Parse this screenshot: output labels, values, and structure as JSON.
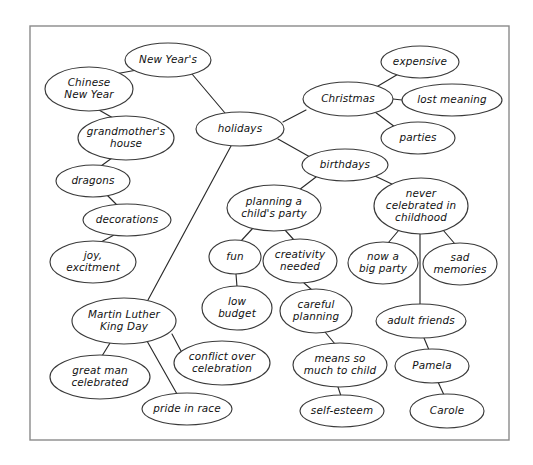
{
  "document": {
    "kind": "concept-map",
    "title": "Holidays concept map",
    "frame": {
      "x": 30,
      "y": 26,
      "width": 479,
      "height": 414
    },
    "canvas": {
      "width": 533,
      "height": 465
    },
    "colors": {
      "background": "#ffffff",
      "frame_stroke": "#8a8a8a",
      "node_stroke": "#3a3a3a",
      "node_fill": "#ffffff",
      "edge_stroke": "#2b2b2b",
      "text": "#111111"
    }
  },
  "nodes": [
    {
      "id": "new-years",
      "label": "New Year's",
      "lines": [
        "New Year's"
      ],
      "cx": 168,
      "cy": 60,
      "rx": 43,
      "ry": 17
    },
    {
      "id": "chinese-new-year",
      "label": "Chinese New Year",
      "lines": [
        "Chinese",
        "New Year"
      ],
      "cx": 89,
      "cy": 89,
      "rx": 44,
      "ry": 22
    },
    {
      "id": "holidays",
      "label": "holidays",
      "lines": [
        "holidays"
      ],
      "cx": 240,
      "cy": 129,
      "rx": 44,
      "ry": 17
    },
    {
      "id": "christmas",
      "label": "Christmas",
      "lines": [
        "Christmas"
      ],
      "cx": 348,
      "cy": 99,
      "rx": 45,
      "ry": 17
    },
    {
      "id": "expensive",
      "label": "expensive",
      "lines": [
        "expensive"
      ],
      "cx": 420,
      "cy": 62,
      "rx": 39,
      "ry": 16
    },
    {
      "id": "lost-meaning",
      "label": "lost meaning",
      "lines": [
        "lost meaning"
      ],
      "cx": 452,
      "cy": 100,
      "rx": 50,
      "ry": 16
    },
    {
      "id": "parties",
      "label": "parties",
      "lines": [
        "parties"
      ],
      "cx": 418,
      "cy": 138,
      "rx": 37,
      "ry": 16
    },
    {
      "id": "birthdays",
      "label": "birthdays",
      "lines": [
        "birthdays"
      ],
      "cx": 345,
      "cy": 165,
      "rx": 43,
      "ry": 16
    },
    {
      "id": "grandmothers-house",
      "label": "grandmother's house",
      "lines": [
        "grandmother's",
        "house"
      ],
      "cx": 126,
      "cy": 138,
      "rx": 48,
      "ry": 22
    },
    {
      "id": "dragons",
      "label": "dragons",
      "lines": [
        "dragons"
      ],
      "cx": 93,
      "cy": 181,
      "rx": 37,
      "ry": 16
    },
    {
      "id": "decorations",
      "label": "decorations",
      "lines": [
        "decorations"
      ],
      "cx": 127,
      "cy": 220,
      "rx": 44,
      "ry": 16
    },
    {
      "id": "joy-excitment",
      "label": "joy, excitment",
      "lines": [
        "joy,",
        "excitment"
      ],
      "cx": 93,
      "cy": 262,
      "rx": 43,
      "ry": 21
    },
    {
      "id": "mlk-day",
      "label": "Martin Luther King Day",
      "lines": [
        "Martin Luther",
        "King Day"
      ],
      "cx": 124,
      "cy": 321,
      "rx": 52,
      "ry": 23
    },
    {
      "id": "great-man",
      "label": "great man celebrated",
      "lines": [
        "great man",
        "celebrated"
      ],
      "cx": 100,
      "cy": 377,
      "rx": 50,
      "ry": 22
    },
    {
      "id": "conflict",
      "label": "conflict over celebration",
      "lines": [
        "conflict over",
        "celebration"
      ],
      "cx": 222,
      "cy": 363,
      "rx": 48,
      "ry": 22
    },
    {
      "id": "pride-in-race",
      "label": "pride in race",
      "lines": [
        "pride in race"
      ],
      "cx": 187,
      "cy": 409,
      "rx": 45,
      "ry": 16
    },
    {
      "id": "planning-party",
      "label": "planning a child's party",
      "lines": [
        "planning a",
        "child's party"
      ],
      "cx": 274,
      "cy": 208,
      "rx": 47,
      "ry": 23
    },
    {
      "id": "fun",
      "label": "fun",
      "lines": [
        "fun"
      ],
      "cx": 235,
      "cy": 257,
      "rx": 26,
      "ry": 17
    },
    {
      "id": "creativity-needed",
      "label": "creativity needed",
      "lines": [
        "creativity",
        "needed"
      ],
      "cx": 300,
      "cy": 261,
      "rx": 37,
      "ry": 22
    },
    {
      "id": "low-budget",
      "label": "low budget",
      "lines": [
        "low",
        "budget"
      ],
      "cx": 237,
      "cy": 308,
      "rx": 35,
      "ry": 22
    },
    {
      "id": "careful-planning",
      "label": "careful planning",
      "lines": [
        "careful",
        "planning"
      ],
      "cx": 316,
      "cy": 311,
      "rx": 36,
      "ry": 22
    },
    {
      "id": "means-so-much",
      "label": "means so much to child",
      "lines": [
        "means so",
        "much to child"
      ],
      "cx": 340,
      "cy": 365,
      "rx": 47,
      "ry": 22
    },
    {
      "id": "self-esteem",
      "label": "self-esteem",
      "lines": [
        "self-esteem"
      ],
      "cx": 342,
      "cy": 411,
      "rx": 42,
      "ry": 16
    },
    {
      "id": "never-celebrated",
      "label": "never celebrated in childhood",
      "lines": [
        "never",
        "celebrated in",
        "childhood"
      ],
      "cx": 421,
      "cy": 206,
      "rx": 47,
      "ry": 28
    },
    {
      "id": "now-a-big-party",
      "label": "now a big party",
      "lines": [
        "now a",
        "big party"
      ],
      "cx": 383,
      "cy": 263,
      "rx": 35,
      "ry": 21
    },
    {
      "id": "sad-memories",
      "label": "sad memories",
      "lines": [
        "sad",
        "memories"
      ],
      "cx": 460,
      "cy": 264,
      "rx": 37,
      "ry": 21
    },
    {
      "id": "adult-friends",
      "label": "adult friends",
      "lines": [
        "adult friends"
      ],
      "cx": 421,
      "cy": 321,
      "rx": 45,
      "ry": 17
    },
    {
      "id": "pamela",
      "label": "Pamela",
      "lines": [
        "Pamela"
      ],
      "cx": 432,
      "cy": 366,
      "rx": 37,
      "ry": 17
    },
    {
      "id": "carole",
      "label": "Carole",
      "lines": [
        "Carole"
      ],
      "cx": 447,
      "cy": 411,
      "rx": 37,
      "ry": 17
    }
  ],
  "edges": [
    {
      "from": "new-years",
      "to": "chinese-new-year",
      "x1": 137,
      "y1": 70,
      "x2": 115,
      "y2": 74
    },
    {
      "from": "new-years",
      "to": "holidays",
      "x1": 192,
      "y1": 74,
      "x2": 225,
      "y2": 113
    },
    {
      "from": "chinese-new-year",
      "to": "grandmothers-house",
      "x1": 99,
      "y1": 110,
      "x2": 113,
      "y2": 118
    },
    {
      "from": "grandmothers-house",
      "to": "dragons",
      "x1": 112,
      "y1": 158,
      "x2": 101,
      "y2": 166
    },
    {
      "from": "dragons",
      "to": "decorations",
      "x1": 107,
      "y1": 195,
      "x2": 117,
      "y2": 205
    },
    {
      "from": "decorations",
      "to": "joy-excitment",
      "x1": 114,
      "y1": 235,
      "x2": 101,
      "y2": 242
    },
    {
      "from": "holidays",
      "to": "christmas",
      "x1": 283,
      "y1": 122,
      "x2": 306,
      "y2": 110
    },
    {
      "from": "holidays",
      "to": "birthdays",
      "x1": 278,
      "y1": 139,
      "x2": 310,
      "y2": 157
    },
    {
      "from": "holidays",
      "to": "mlk-day",
      "x1": 231,
      "y1": 146,
      "x2": 148,
      "y2": 300
    },
    {
      "from": "christmas",
      "to": "expensive",
      "x1": 378,
      "y1": 86,
      "x2": 400,
      "y2": 73
    },
    {
      "from": "christmas",
      "to": "lost-meaning",
      "x1": 393,
      "y1": 99,
      "x2": 402,
      "y2": 100
    },
    {
      "from": "christmas",
      "to": "parties",
      "x1": 375,
      "y1": 112,
      "x2": 395,
      "y2": 127
    },
    {
      "from": "birthdays",
      "to": "planning-party",
      "x1": 316,
      "y1": 177,
      "x2": 299,
      "y2": 190
    },
    {
      "from": "birthdays",
      "to": "never-celebrated",
      "x1": 375,
      "y1": 176,
      "x2": 396,
      "y2": 186
    },
    {
      "from": "planning-party",
      "to": "fun",
      "x1": 253,
      "y1": 228,
      "x2": 241,
      "y2": 241
    },
    {
      "from": "planning-party",
      "to": "creativity-needed",
      "x1": 285,
      "y1": 230,
      "x2": 294,
      "y2": 240
    },
    {
      "from": "fun",
      "to": "low-budget",
      "x1": 236,
      "y1": 274,
      "x2": 237,
      "y2": 287
    },
    {
      "from": "creativity-needed",
      "to": "careful-planning",
      "x1": 304,
      "y1": 283,
      "x2": 312,
      "y2": 290
    },
    {
      "from": "careful-planning",
      "to": "means-so-much",
      "x1": 325,
      "y1": 332,
      "x2": 335,
      "y2": 344
    },
    {
      "from": "means-so-much",
      "to": "self-esteem",
      "x1": 338,
      "y1": 387,
      "x2": 341,
      "y2": 396
    },
    {
      "from": "never-celebrated",
      "to": "now-a-big-party",
      "x1": 399,
      "y1": 230,
      "x2": 388,
      "y2": 243
    },
    {
      "from": "never-celebrated",
      "to": "sad-memories",
      "x1": 443,
      "y1": 230,
      "x2": 455,
      "y2": 244
    },
    {
      "from": "never-celebrated",
      "to": "adult-friends",
      "x1": 420,
      "y1": 234,
      "x2": 420,
      "y2": 305
    },
    {
      "from": "adult-friends",
      "to": "pamela",
      "x1": 424,
      "y1": 338,
      "x2": 429,
      "y2": 350
    },
    {
      "from": "pamela",
      "to": "carole",
      "x1": 438,
      "y1": 382,
      "x2": 444,
      "y2": 395
    },
    {
      "from": "mlk-day",
      "to": "great-man",
      "x1": 110,
      "y1": 343,
      "x2": 102,
      "y2": 356
    },
    {
      "from": "mlk-day",
      "to": "pride-in-race",
      "x1": 147,
      "y1": 341,
      "x2": 177,
      "y2": 394
    },
    {
      "from": "mlk-day",
      "to": "conflict",
      "x1": 172,
      "y1": 334,
      "x2": 181,
      "y2": 351
    }
  ]
}
